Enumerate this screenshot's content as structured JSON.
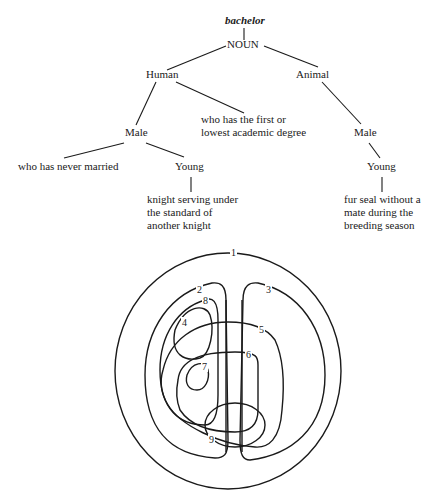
{
  "tree": {
    "root": "bachelor",
    "pos": "NOUN",
    "nodes": {
      "human": "Human",
      "animal": "Animal",
      "human_male": "Male",
      "animal_male": "Male",
      "human_young": "Young",
      "animal_young": "Young"
    },
    "senses": {
      "never_married": "who has never married",
      "academic": [
        "who has the first or",
        "lowest academic degree"
      ],
      "knight": [
        "knight serving under",
        "the standard of",
        "another knight"
      ],
      "fur_seal": [
        "fur seal without a",
        "mate during the",
        "breeding season"
      ]
    }
  },
  "venn": {
    "labels": [
      "1",
      "2",
      "3",
      "4",
      "5",
      "6",
      "7",
      "8",
      "9"
    ]
  }
}
